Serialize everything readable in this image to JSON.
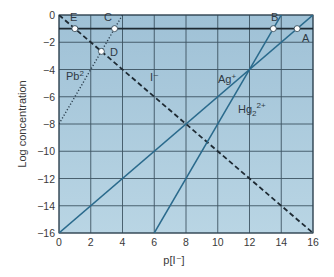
{
  "chart_data": {
    "type": "line",
    "title": "",
    "xlabel": "p[I⁻]",
    "ylabel": "Log concentration",
    "xlim": [
      0,
      16
    ],
    "ylim": [
      -16,
      0
    ],
    "x_ticks": [
      0,
      2,
      4,
      6,
      8,
      10,
      12,
      14,
      16
    ],
    "y_ticks": [
      0,
      -2,
      -4,
      -6,
      -8,
      -10,
      -12,
      -14,
      -16
    ],
    "x_tick_labels": [
      "0",
      "2",
      "4",
      "6",
      "8",
      "10",
      "12",
      "14",
      "16"
    ],
    "y_tick_labels": [
      "0",
      "−2",
      "−4",
      "−6",
      "−8",
      "−10",
      "−12",
      "−14",
      "−16"
    ],
    "grid": true,
    "legend": "none (inline labels)",
    "series": [
      {
        "name": "I⁻",
        "style": "dashed",
        "color": "#1e2a33",
        "x": [
          0,
          16
        ],
        "y": [
          0,
          -16
        ]
      },
      {
        "name": "Pb2+",
        "label": "Pb",
        "label_sup": "2",
        "style": "dotted",
        "color": "#2b3e4d",
        "x": [
          0,
          4
        ],
        "y": [
          -8,
          0
        ]
      },
      {
        "name": "Ag⁺",
        "label": "Ag",
        "label_sup": "+",
        "style": "solid",
        "color": "#2a6a8c",
        "x": [
          0,
          16
        ],
        "y": [
          -16,
          0
        ]
      },
      {
        "name": "Hg2 2+",
        "label": "Hg",
        "label_sub": "2",
        "label_sup": "2+",
        "style": "solid",
        "color": "#2a6a8c",
        "x": [
          6,
          14.5
        ],
        "y": [
          -16,
          1
        ]
      },
      {
        "name": "reference",
        "style": "solid",
        "color": "#1e2a33",
        "x": [
          0,
          16
        ],
        "y": [
          -1,
          -1
        ]
      }
    ],
    "points": [
      {
        "label": "A",
        "x": 15,
        "y": -1
      },
      {
        "label": "B",
        "x": 13.5,
        "y": -1
      },
      {
        "label": "C",
        "x": 3.5,
        "y": -1
      },
      {
        "label": "D",
        "x": 2.67,
        "y": -2.67
      },
      {
        "label": "E",
        "x": 1,
        "y": -1
      }
    ],
    "colors": {
      "plot_background": "#a9c9dc",
      "grid": "#1f3442",
      "line_blue": "#2a6a8c",
      "dashed": "#1e2a33"
    }
  },
  "labels": {
    "xlabel": "p[I⁻]",
    "ylabel": "Log concentration",
    "I": "I⁻",
    "Pb": "Pb",
    "Pb_sup": "2",
    "Ag": "Ag",
    "Ag_sup": "+",
    "Hg": "Hg",
    "Hg_sub": "2",
    "Hg_sup": "2+",
    "A": "A",
    "B": "B",
    "C": "C",
    "D": "D",
    "E": "E"
  }
}
